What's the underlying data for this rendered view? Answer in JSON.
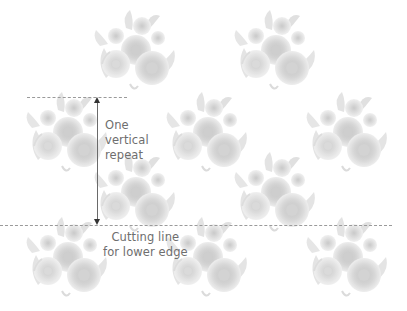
{
  "diagram": {
    "type": "half-drop wallpaper repeat illustration",
    "labels": {
      "vertical_repeat": "One\nvertical\nrepeat",
      "cutting_line": "Cutting line\nfor lower edge"
    },
    "colors": {
      "background": "#ffffff",
      "motif": "#c8c8c8",
      "dash_line": "#9a9a9a",
      "arrow": "#333333",
      "label_text": "#6e6e6e"
    },
    "motif": "floral-bouquet",
    "motif_positions": [
      {
        "x": 86,
        "y": 8
      },
      {
        "x": 226,
        "y": 8
      },
      {
        "x": 18,
        "y": 90
      },
      {
        "x": 158,
        "y": 90
      },
      {
        "x": 298,
        "y": 90
      },
      {
        "x": 86,
        "y": 150
      },
      {
        "x": 226,
        "y": 150
      },
      {
        "x": 18,
        "y": 215
      },
      {
        "x": 158,
        "y": 215
      },
      {
        "x": 298,
        "y": 215
      }
    ]
  }
}
